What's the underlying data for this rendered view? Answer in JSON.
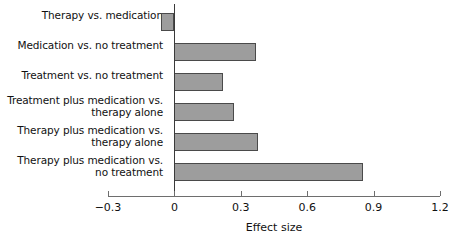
{
  "chart_data": {
    "type": "bar",
    "orientation": "horizontal",
    "title": "",
    "xlabel": "Effect size",
    "ylabel": "",
    "xlim": [
      -0.3,
      1.2
    ],
    "xticks": [
      "−0.3",
      "0",
      "0.3",
      "0.6",
      "0.9",
      "1.2"
    ],
    "xtick_values": [
      -0.3,
      0,
      0.3,
      0.6,
      0.9,
      1.2
    ],
    "grid": false,
    "legend": null,
    "zero_reference_line": true,
    "categories": [
      "Therapy vs. medication",
      "Medication vs. no treatment",
      "Treatment vs. no treatment",
      "Treatment plus medication vs.\ntherapy alone",
      "Therapy plus medication vs.\ntherapy alone",
      "Therapy plus medication vs.\nno treatment"
    ],
    "values": [
      -0.06,
      0.37,
      0.22,
      0.27,
      0.38,
      0.85
    ],
    "bar_fill_color": "#9d9d9d",
    "bar_border_color": "#4a4a4a",
    "axis_color": "#6e6e6e",
    "text_color": "#111111"
  }
}
